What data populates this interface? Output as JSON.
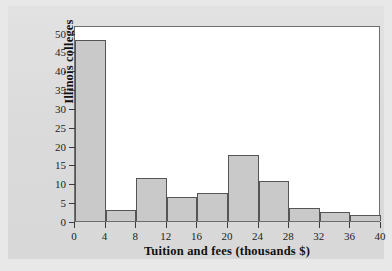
{
  "chart_data": {
    "type": "bar",
    "title": "",
    "subtitle": "",
    "xlabel": "Tuition and fees (thousands $)",
    "ylabel": "Illinois colleges",
    "grid": false,
    "legend": null,
    "bin_width": 4,
    "xlim": [
      0,
      40
    ],
    "ylim": [
      0,
      52
    ],
    "xticks": [
      "0",
      "4",
      "8",
      "12",
      "16",
      "20",
      "24",
      "28",
      "32",
      "36",
      "40"
    ],
    "xtick_values": [
      0,
      4,
      8,
      12,
      16,
      20,
      24,
      28,
      32,
      36,
      40
    ],
    "yticks": [
      "0",
      "5",
      "10",
      "15",
      "20",
      "25",
      "30",
      "35",
      "40",
      "45",
      "50"
    ],
    "ytick_values": [
      0,
      5,
      10,
      15,
      20,
      25,
      30,
      35,
      40,
      45,
      50
    ],
    "categories": [
      "0-4",
      "4-8",
      "8-12",
      "12-16",
      "16-20",
      "20-24",
      "24-28",
      "28-32",
      "32-36",
      "36-40"
    ],
    "bin_starts": [
      0,
      4,
      8,
      12,
      16,
      20,
      24,
      28,
      32,
      36
    ],
    "bin_ends": [
      4,
      8,
      12,
      16,
      20,
      24,
      28,
      32,
      36,
      40
    ],
    "values": [
      48,
      3,
      11.5,
      6.5,
      7.5,
      17.5,
      10.5,
      3.5,
      2.5,
      1.5
    ],
    "colors": {
      "bar_fill": "#c9c9c9",
      "bar_stroke": "#555555",
      "plot_background": "#ffffff",
      "page_background": "#dedede",
      "axis": "#3a3a3a",
      "text": "#101010"
    }
  }
}
